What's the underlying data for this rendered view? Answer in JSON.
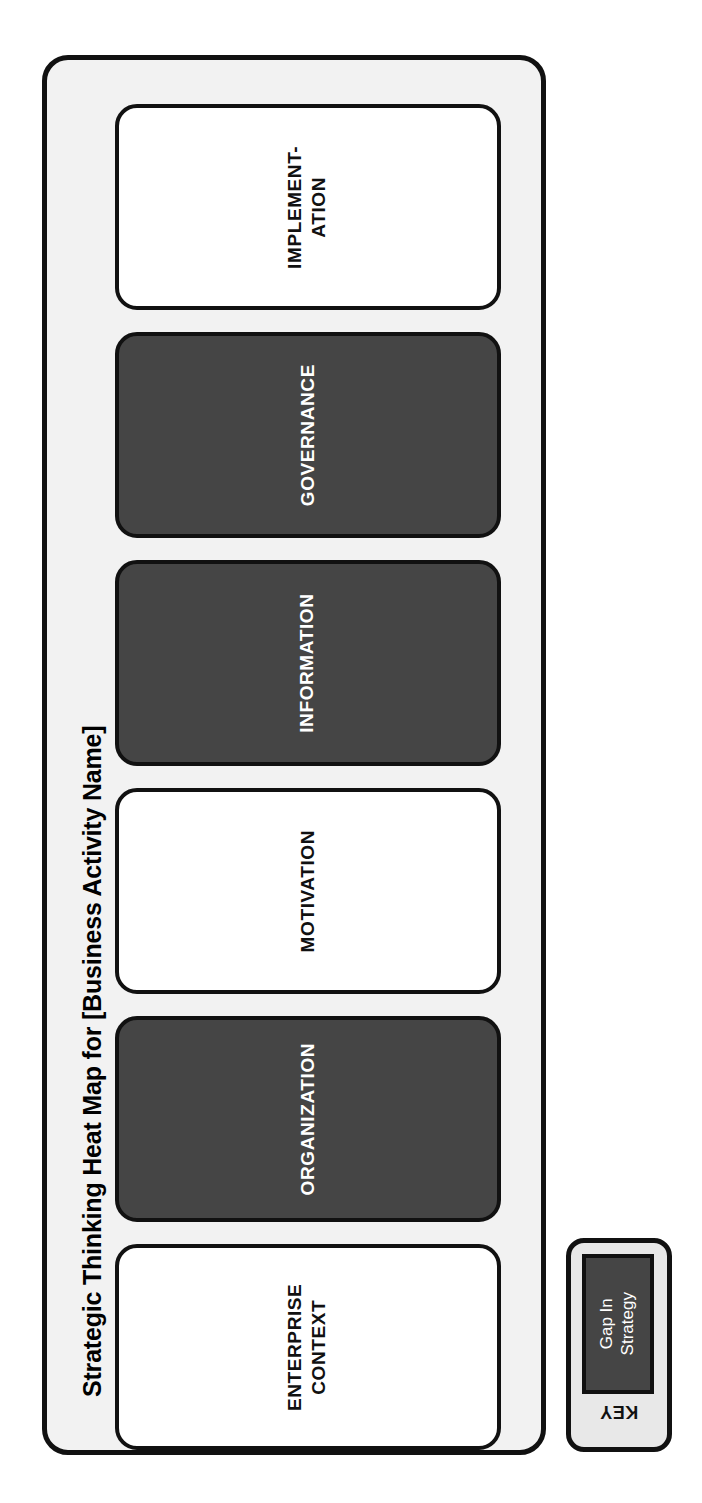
{
  "panel": {
    "title": "Strategic Thinking Heat Map for [Business Activity Name]"
  },
  "cards": [
    {
      "label": "IMPLEMENT-\nATION",
      "state": "normal",
      "state_name": "No Gap"
    },
    {
      "label": "GOVERNANCE",
      "state": "gap",
      "state_name": "Gap In Strategy"
    },
    {
      "label": "INFORMATION",
      "state": "gap",
      "state_name": "Gap In Strategy"
    },
    {
      "label": "MOTIVATION",
      "state": "normal",
      "state_name": "No Gap"
    },
    {
      "label": "ORGANIZATION",
      "state": "gap",
      "state_name": "Gap In Strategy"
    },
    {
      "label": "ENTERPRISE\nCONTEXT",
      "state": "normal",
      "state_name": "No Gap"
    }
  ],
  "key": {
    "title": "KEY",
    "swatch_label": "Gap In\nStrategy"
  },
  "colors": {
    "gap_fill": "#454545",
    "normal_fill": "#ffffff",
    "panel_background": "#f2f2f2",
    "key_background": "#e8e8e8",
    "outline": "#111111",
    "text_dark": "#111111",
    "text_light": "#ffffff"
  },
  "layout": {
    "card_tops": [
      22,
      250,
      478,
      706,
      934,
      1162
    ],
    "card_height": 206
  }
}
